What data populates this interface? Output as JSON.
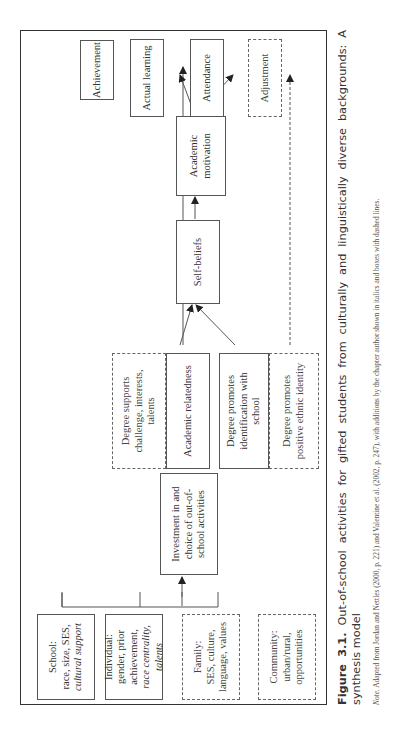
{
  "figure": {
    "label": "Figure 3.1.",
    "title": "Out-of-school activities for gifted students from culturally and linguistically diverse backgrounds: A synthesis model",
    "note_label": "Note.",
    "note_text": "Adapted from Jordan and Nettles (2000, p. 221) and Valentine et al. (2002, p. 247), with additions by the chapter author shown in italics and boxes with dashed lines."
  },
  "diagram": {
    "inputs": [
      {
        "title": "School:",
        "line1": "race, size, SES,",
        "italic": "cultural support",
        "style": "solid"
      },
      {
        "title": "Individual:",
        "line1": "gender, prior achievement,",
        "italic": "race centrality, talents",
        "style": "solid"
      },
      {
        "title": "Family:",
        "line1": "SES, culture, language, values",
        "italic": "",
        "style": "dashed"
      },
      {
        "title": "Community:",
        "line1": "urban/rural, opportunities",
        "italic": "",
        "style": "dashed"
      }
    ],
    "investment": "Investment in and choice of out-of-school activities",
    "mediators": [
      {
        "label": "Degree supports challenge, interests, talents",
        "style": "dashed"
      },
      {
        "label": "Academic relatedness",
        "style": "solid"
      },
      {
        "label": "Degree promotes identification with school",
        "style": "solid"
      },
      {
        "label": "Degree promotes positive ethnic identity",
        "style": "dashed"
      }
    ],
    "self_beliefs": "Self-beliefs",
    "academic_motivation": "Academic motivation",
    "outcomes": [
      {
        "label": "Achievement",
        "style": "solid"
      },
      {
        "label": "Actual learning",
        "style": "solid"
      },
      {
        "label": "Attendance",
        "style": "solid"
      },
      {
        "label": "Adjustment",
        "style": "dashed"
      }
    ],
    "colors": {
      "line": "#555555",
      "text": "#333333",
      "background": "#ffffff"
    }
  }
}
